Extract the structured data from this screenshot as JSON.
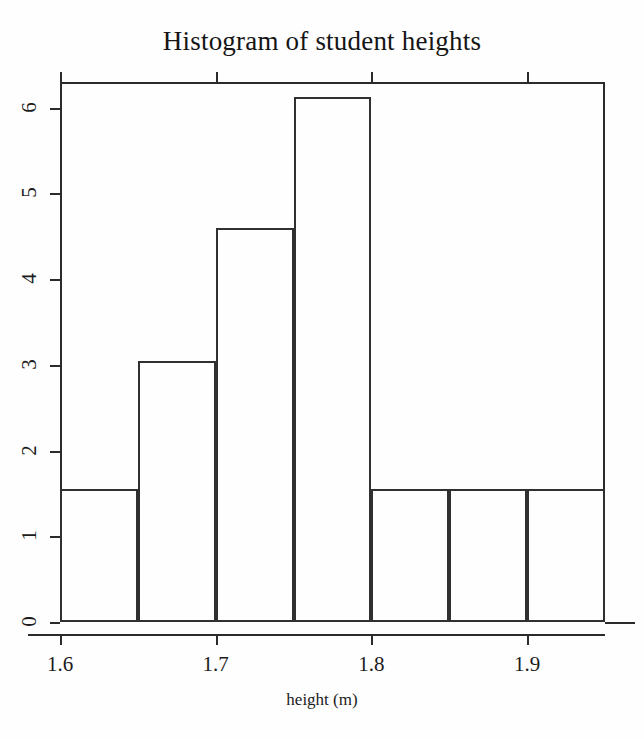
{
  "chart_data": {
    "type": "bar",
    "title": "Histogram of student heights",
    "xlabel": "height (m)",
    "ylabel": "",
    "xlim": [
      1.6,
      1.95
    ],
    "ylim": [
      0,
      6.3
    ],
    "grid": false,
    "legend": null,
    "bin_width": 0.05,
    "bin_edges": [
      1.6,
      1.65,
      1.7,
      1.75,
      1.8,
      1.85,
      1.9,
      1.95
    ],
    "categories": [
      "1.60-1.65",
      "1.65-1.70",
      "1.70-1.75",
      "1.75-1.80",
      "1.80-1.85",
      "1.85-1.90",
      "1.90-1.95"
    ],
    "values": [
      1.55,
      3.05,
      4.6,
      6.12,
      1.55,
      1.55,
      1.55
    ],
    "x_tick_labels": [
      "1.6",
      "1.7",
      "1.8",
      "1.9"
    ],
    "x_tick_values": [
      1.6,
      1.7,
      1.8,
      1.9
    ],
    "y_tick_labels": [
      "0",
      "1",
      "2",
      "3",
      "4",
      "5",
      "6"
    ],
    "y_tick_values": [
      0,
      1,
      2,
      3,
      4,
      5,
      6
    ]
  },
  "figure": {
    "title": "Histogram of student heights",
    "x_axis_title": "height (m)",
    "frame_color": "#2b2b2b",
    "bar_outline_color": "#303030",
    "background_color": "#ffffff"
  }
}
